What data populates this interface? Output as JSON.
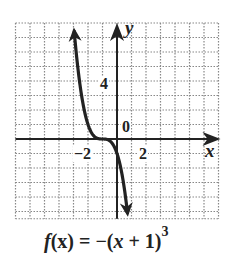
{
  "chart_data": {
    "type": "line",
    "function": "-(x+1)^3",
    "xlabel": "x",
    "ylabel": "y",
    "xlim": [
      -7,
      7
    ],
    "ylim": [
      -5.5,
      8
    ],
    "grid": true,
    "grid_step": 1,
    "tick_labels": {
      "x": [
        {
          "value": -2,
          "label": "−2"
        },
        {
          "value": 2,
          "label": "2"
        }
      ],
      "y": [
        {
          "value": 4,
          "label": "4"
        },
        {
          "value": 0,
          "label": "0"
        }
      ]
    },
    "points": [
      {
        "x": -3.0,
        "y": 8.0
      },
      {
        "x": -2.5,
        "y": 3.375
      },
      {
        "x": -2.0,
        "y": 1.0
      },
      {
        "x": -1.5,
        "y": 0.125
      },
      {
        "x": -1.0,
        "y": 0.0
      },
      {
        "x": -0.5,
        "y": -0.125
      },
      {
        "x": 0.0,
        "y": -1.0
      },
      {
        "x": 0.5,
        "y": -3.375
      },
      {
        "x": 0.75,
        "y": -5.36
      }
    ],
    "arrows": [
      "both ends"
    ],
    "colors": {
      "curve": "#222222",
      "grid": "#888888",
      "axes": "#222222"
    }
  },
  "caption": {
    "prefix": "f",
    "arg": "(x)",
    "eq": " = −(",
    "var": "x",
    "rest": " + 1)",
    "exp": "3"
  },
  "labels": {
    "y_axis": "y",
    "x_axis": "x",
    "tick_neg2": "−2",
    "tick_2": "2",
    "tick_4": "4",
    "tick_0": "0"
  }
}
